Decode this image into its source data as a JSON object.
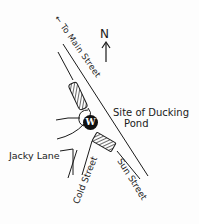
{
  "map": {
    "style": "hand-drawn sketch map",
    "colors": {
      "ink": "#1a1a1a",
      "paper": "#fdfdfd",
      "marker_fill": "#111111",
      "marker_text": "#ffffff"
    },
    "compass": {
      "label": "N",
      "icon": "north-arrow-icon"
    },
    "direction_label": {
      "arrow": "←",
      "text": "To Main Street"
    },
    "streets": [
      {
        "id": "sun-street",
        "label": "Sun Street"
      },
      {
        "id": "cold-street",
        "label": "Cold Street"
      },
      {
        "id": "jacky-lane",
        "label": "Jacky Lane"
      }
    ],
    "landmarks": [
      {
        "id": "ducking-pond",
        "label_line1": "Site of Ducking",
        "label_line2": "Pond",
        "marker": "W"
      }
    ],
    "buildings": [
      {
        "id": "building-north",
        "pattern": "hatched"
      },
      {
        "id": "building-south",
        "pattern": "hatched"
      }
    ]
  }
}
